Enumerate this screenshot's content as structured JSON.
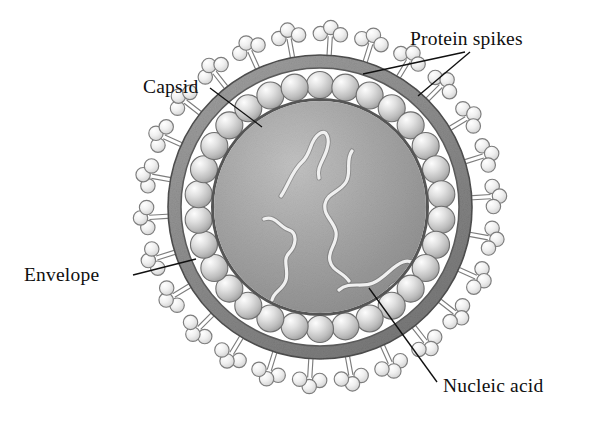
{
  "figure": {
    "background_color": "#ffffff",
    "width": 594,
    "height": 422
  },
  "labels": [
    {
      "id": "protein-spikes",
      "text": "Protein spikes",
      "x": 410,
      "y": 45,
      "anchor": "start",
      "leader": "forked",
      "points_to": [
        "spike-top-left-cluster",
        "spike-top-right-cluster"
      ]
    },
    {
      "id": "capsid",
      "text": "Capsid",
      "x": 143,
      "y": 93,
      "anchor": "start",
      "leader": "straight",
      "points_to": [
        "capsomere-ring"
      ]
    },
    {
      "id": "envelope",
      "text": "Envelope",
      "x": 24,
      "y": 281,
      "anchor": "start",
      "leader": "straight",
      "points_to": [
        "envelope-ring"
      ]
    },
    {
      "id": "nucleic-acid",
      "text": "Nucleic acid",
      "x": 443,
      "y": 392,
      "anchor": "start",
      "leader": "straight",
      "points_to": [
        "nucleic-acid-strands"
      ]
    }
  ],
  "leader_lines": [
    {
      "id": "leader-protein-spikes-a",
      "from": [
        465,
        52
      ],
      "to": [
        363,
        74
      ]
    },
    {
      "id": "leader-protein-spikes-b",
      "from": [
        470,
        52
      ],
      "to": [
        418,
        96
      ]
    },
    {
      "id": "leader-capsid",
      "from": [
        210,
        88
      ],
      "to": [
        262,
        127
      ]
    },
    {
      "id": "leader-envelope",
      "from": [
        133,
        275
      ],
      "to": [
        196,
        259
      ]
    },
    {
      "id": "leader-nucleic-acid",
      "from": [
        437,
        382
      ],
      "to": [
        369,
        288
      ]
    }
  ],
  "structure": {
    "center": {
      "x": 320,
      "y": 207
    },
    "envelope": {
      "name": "envelope",
      "outer_radius": 152,
      "inner_radius": 139,
      "fill": "#8d8d8d",
      "stroke": "#4a4a4a",
      "description": "thick grainy gray outer membrane ring"
    },
    "capsid": {
      "name": "capsid",
      "ring_radius": 122,
      "capsomere_count": 30,
      "capsomere_radius": 13.5,
      "fill_light": "#f2f2f2",
      "fill_mid": "#c9c9c9",
      "fill_dark": "#9a9a9a",
      "stroke": "#6e6e6e",
      "description": "ring of spherical capsomere subunits forming protein coat"
    },
    "core": {
      "name": "nucleocapsid-core",
      "radius": 106,
      "fill_light": "#b9b9b9",
      "fill_dark": "#8f8f8f",
      "stroke": "#5d5d5d",
      "description": "grainy gray interior enclosed by capsid"
    },
    "nucleic_acid": {
      "name": "nucleic-acid",
      "strand_count": 4,
      "stroke": "#ececec",
      "stroke_dark": "#6f6f6f",
      "stroke_width": 3.2,
      "description": "light wavy genome strands inside the core"
    },
    "spikes": {
      "name": "protein-spikes",
      "count": 26,
      "stalk_length": 22,
      "lobe_radius": 7.2,
      "fill_light": "#fbfbfb",
      "fill_mid": "#dcdcdc",
      "stroke": "#7d7d7d",
      "description": "trefoil glycoprotein clusters on short stalks projecting from envelope"
    }
  },
  "colors": {
    "background": "#ffffff",
    "ink": "#101010",
    "envelope_gray": "#8d8d8d",
    "core_gray": "#a5a5a5",
    "capsomere_gray": "#d4d4d4",
    "spike_gray": "#e8e8e8",
    "outline": "#5d5d5d"
  }
}
